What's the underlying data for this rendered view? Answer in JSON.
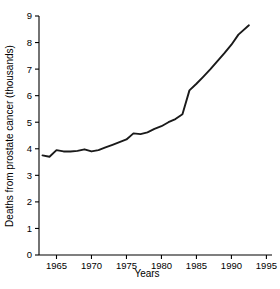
{
  "chart_data": {
    "type": "line",
    "title": "",
    "subtitle": "",
    "xlabel": "Years",
    "ylabel": "Deaths from prostate cancer (thousands)",
    "xlim": [
      1962.5,
      1995.8
    ],
    "ylim": [
      0,
      9
    ],
    "grid": false,
    "legend": null,
    "x_ticks": [
      "1965",
      "1970",
      "1975",
      "1980",
      "1985",
      "1990",
      "1995"
    ],
    "x_tick_values": [
      1965,
      1970,
      1975,
      1980,
      1985,
      1990,
      1995
    ],
    "y_ticks": [
      "0",
      "1",
      "2",
      "3",
      "4",
      "5",
      "6",
      "7",
      "8",
      "9"
    ],
    "y_tick_values": [
      0,
      1,
      2,
      3,
      4,
      5,
      6,
      7,
      8,
      9
    ],
    "series": [
      {
        "name": "Deaths from prostate cancer",
        "color": "#1a1a1a",
        "x": [
          1963,
          1964,
          1965,
          1966,
          1967,
          1968,
          1969,
          1970,
          1971,
          1972,
          1973,
          1974,
          1975,
          1976,
          1977,
          1978,
          1979,
          1980,
          1981,
          1982,
          1983,
          1984,
          1985,
          1986,
          1987,
          1988,
          1989,
          1990,
          1991,
          1992.5
        ],
        "values": [
          3.75,
          3.7,
          3.95,
          3.9,
          3.9,
          3.92,
          3.98,
          3.9,
          3.95,
          4.05,
          4.15,
          4.25,
          4.35,
          4.58,
          4.55,
          4.62,
          4.75,
          4.85,
          5.0,
          5.12,
          5.3,
          6.2,
          6.45,
          6.72,
          7.0,
          7.3,
          7.6,
          7.92,
          8.3,
          8.65
        ]
      }
    ]
  },
  "axis": {
    "x_title": "Years",
    "y_title": "Deaths from prostate cancer (thousands)"
  }
}
